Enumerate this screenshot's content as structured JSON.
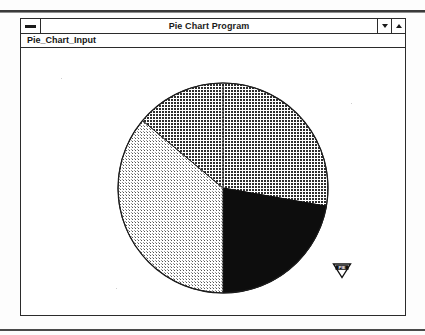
{
  "window": {
    "title": "Pie Chart Program",
    "menu_button_icon": "window-menu-dash-icon",
    "minimize_icon": "triangle-down-icon",
    "maximize_icon": "triangle-up-icon"
  },
  "menu_bar": {
    "items": [
      {
        "label": "Pie_Chart_Input",
        "name": "menu-item-pie-chart-input"
      }
    ]
  },
  "cursor": {
    "label": "PIE",
    "icon": "pie-pointer-icon"
  },
  "colors": {
    "window_border": "#2b2b2b",
    "background": "#ffffff",
    "text": "#1a1a1a",
    "slice_dark": "#4a4a4a",
    "slice_black": "#0d0d0d",
    "slice_light": "#c8c8c8"
  },
  "chart_data": {
    "type": "pie",
    "title": "",
    "center": {
      "x": 202,
      "y": 140
    },
    "radius": 105,
    "start_angle_deg": 0,
    "direction": "clockwise",
    "grid": false,
    "legend": "none",
    "labels": [],
    "slices": [
      {
        "name": "slice-1",
        "label": "",
        "value": 28,
        "percent": 28,
        "start_angle_deg": 0,
        "end_angle_deg": 100,
        "fill": "crosshatch-dark",
        "color": "#4a4a4a"
      },
      {
        "name": "slice-2",
        "label": "",
        "value": 22,
        "percent": 22,
        "start_angle_deg": 100,
        "end_angle_deg": 180,
        "fill": "solid-black",
        "color": "#0d0d0d"
      },
      {
        "name": "slice-3",
        "label": "",
        "value": 36,
        "percent": 36,
        "start_angle_deg": 180,
        "end_angle_deg": 310,
        "fill": "dotted-light",
        "color": "#c8c8c8"
      },
      {
        "name": "slice-4",
        "label": "",
        "value": 14,
        "percent": 14,
        "start_angle_deg": 310,
        "end_angle_deg": 360,
        "fill": "crosshatch-dark",
        "color": "#4a4a4a"
      }
    ]
  }
}
